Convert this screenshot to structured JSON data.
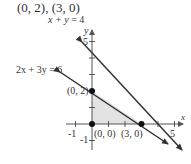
{
  "title": "(0, 2), (3, 0)",
  "lines": [
    {
      "label_lhs": "x + y",
      "label_rhs": "= 4",
      "equation": "x + y = 4"
    },
    {
      "label_lhs": "2x + 3y",
      "label_rhs": "= 6",
      "equation": "2x + 3y = 6"
    }
  ],
  "axes": {
    "x_label": "x",
    "y_label": "y",
    "x_ticks": [
      "-1",
      "5"
    ],
    "y_ticks": [
      "5",
      "-1"
    ]
  },
  "points": [
    {
      "label": "(0, 2)",
      "x": 0,
      "y": 2
    },
    {
      "label": "(0, 0)",
      "x": 0,
      "y": 0
    },
    {
      "label": "(3, 0)",
      "x": 3,
      "y": 0
    }
  ],
  "shaded_region": {
    "vertices": [
      [
        0,
        0
      ],
      [
        0,
        2
      ],
      [
        3,
        0
      ]
    ],
    "color": "#e3e3e3"
  },
  "colors": {
    "line": "#333333",
    "axis": "#555555",
    "shade": "#e3e3e3"
  }
}
